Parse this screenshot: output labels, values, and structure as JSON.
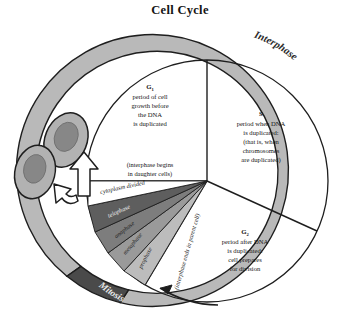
{
  "title": "Cell Cycle",
  "ring": {
    "interphase_label": "Interphase",
    "mitosis_label": "Mitosis",
    "interphase_color": "#b9b9b9",
    "mitosis_color": "#4a4a4a",
    "outline_color": "#1e1e1e"
  },
  "sectors": [
    {
      "id": "g1",
      "name": "G",
      "subscript": "1",
      "lines": [
        "period of cell",
        "growth before",
        "the DNA",
        "is duplicated"
      ]
    },
    {
      "id": "s",
      "name": "S",
      "subscript": "",
      "lines": [
        "period when DNA",
        "is duplicated:",
        "(that is, when",
        "chromosomes",
        "are duplicated)"
      ]
    },
    {
      "id": "g2",
      "name": "G",
      "subscript": "2",
      "lines": [
        "period after DNA",
        "is duplicated:",
        "cell prepares",
        "for division"
      ]
    }
  ],
  "notes": {
    "interphase_begins": [
      "(interphase begins",
      "in daughter cells)"
    ],
    "cytoplasm_divided": "cytoplasm divided",
    "interphase_ends": "(interphase ends in parent cell)"
  },
  "mitosis_phases": [
    {
      "label": "telophase",
      "color": "#5e5e5e",
      "text_color": "light"
    },
    {
      "label": "anaphase",
      "color": "#7d7d7d",
      "text_color": "dark"
    },
    {
      "label": "metaphase",
      "color": "#9a9a9a",
      "text_color": "dark"
    },
    {
      "label": "prophase",
      "color": "#bcbcbc",
      "text_color": "dark"
    }
  ],
  "daughter_cells": {
    "count": 2,
    "membrane_color": "#b2b2b2",
    "nucleus_color": "#878787"
  },
  "arrows": {
    "division_arrow": "white-block-arrow-up",
    "branch_arrow": "white-curved-arrow-left",
    "cycle_direction_arrow": "thin-arrow-counterclockwise"
  },
  "colors": {
    "background": "#ffffff",
    "stroke": "#1e1e1e",
    "text": "#141414"
  }
}
